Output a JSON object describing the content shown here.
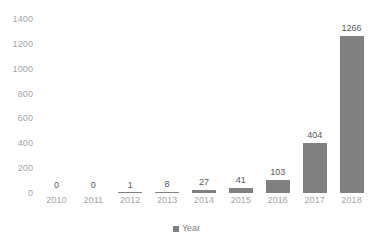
{
  "chart_data": {
    "type": "bar",
    "title": "",
    "subtitle": "",
    "xlabel": "",
    "ylabel": "",
    "categories": [
      "2010",
      "2011",
      "2012",
      "2013",
      "2014",
      "2015",
      "2016",
      "2017",
      "2018"
    ],
    "values": [
      0,
      0,
      1,
      8,
      27,
      41,
      103,
      404,
      1266
    ],
    "series": [
      {
        "name": "Year",
        "values": [
          0,
          0,
          1,
          8,
          27,
          41,
          103,
          404,
          1266
        ]
      }
    ],
    "data_labels": [
      "0",
      "0",
      "1",
      "8",
      "27",
      "41",
      "103",
      "404",
      "1266"
    ],
    "ylim": [
      0,
      1400
    ],
    "y_ticks": [
      0,
      200,
      400,
      600,
      800,
      1000,
      1200,
      1400
    ],
    "y_tick_labels": [
      "0",
      "200",
      "400",
      "600",
      "800",
      "1000",
      "1200",
      "1400"
    ],
    "grid": false,
    "legend_position": "bottom",
    "legend_entries": [
      "Year"
    ],
    "colors": {
      "bar": "#808080",
      "data_label": "#595959",
      "tick_label": "#a6a6a6",
      "legend_label": "#7f7f7f",
      "background": "#ffffff"
    }
  },
  "legend": {
    "series_label": "Year"
  }
}
